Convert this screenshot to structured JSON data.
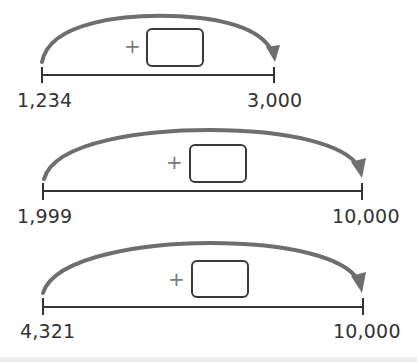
{
  "problems": [
    {
      "start_label": "1,234",
      "end_label": "3,000",
      "operator": "+",
      "answer": ""
    },
    {
      "start_label": "1,999",
      "end_label": "10,000",
      "operator": "+",
      "answer": ""
    },
    {
      "start_label": "4,321",
      "end_label": "10,000",
      "operator": "+",
      "answer": ""
    }
  ],
  "colors": {
    "arc": "#6e6e6e",
    "number_line": "#333333",
    "box_border": "#3a3a3a",
    "text": "#333333"
  }
}
